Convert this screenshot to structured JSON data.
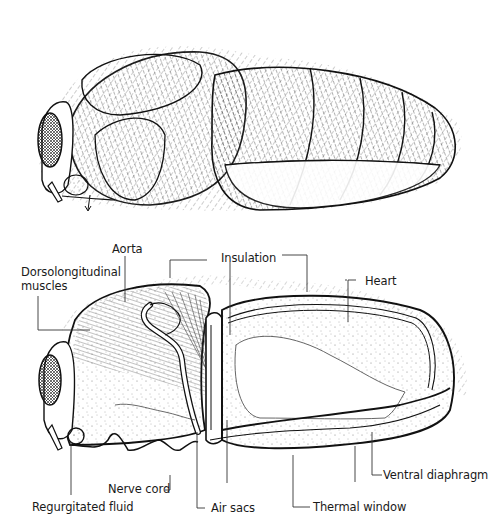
{
  "figure": {
    "top_panel": {
      "description": "External lateral view of hairy insect body showing head with compound eye, thorax, and segmented abdomen"
    },
    "bottom_panel": {
      "description": "Internal sagittal section of the same insect",
      "labels": {
        "aorta": "Aorta",
        "dorsolongitudinal_muscles_line1": "Dorsolongitudinal",
        "dorsolongitudinal_muscles_line2": "muscles",
        "insulation": "Insulation",
        "heart": "Heart",
        "nerve_cord": "Nerve cord",
        "regurgitated_fluid": "Regurgitated fluid",
        "air_sacs": "Air sacs",
        "thermal_window": "Thermal window",
        "ventral_diaphragm": "Ventral diaphragm"
      }
    }
  },
  "colors": {
    "ink": "#1a1a1a",
    "background": "#ffffff",
    "stipple": "#6a6a6a"
  }
}
